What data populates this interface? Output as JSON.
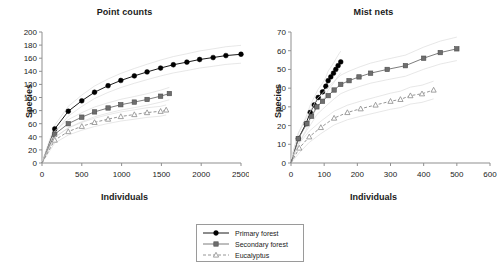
{
  "figure": {
    "legend": {
      "entries": [
        {
          "label": "Primary forest",
          "marker": "filled-circle",
          "line": "solid",
          "color": "#000000"
        },
        {
          "label": "Secondary forest",
          "marker": "filled-square",
          "line": "solid",
          "color": "#6e6e6e"
        },
        {
          "label": "Eucalyptus",
          "marker": "open-triangle",
          "line": "dashed",
          "color": "#8a8a8a"
        }
      ]
    }
  },
  "chart_data": [
    {
      "type": "line",
      "title": "Point counts",
      "xlabel": "Individuals",
      "ylabel": "Species",
      "xlim": [
        0,
        2500
      ],
      "ylim": [
        0,
        200
      ],
      "xticks": [
        0,
        500,
        1000,
        1500,
        2000,
        2500
      ],
      "yticks": [
        0,
        20,
        40,
        60,
        80,
        100,
        120,
        140,
        160,
        180,
        200
      ],
      "grid": false,
      "legend_position": "below-center-shared",
      "series": [
        {
          "name": "Primary forest",
          "marker": "filled-circle",
          "line": "solid",
          "color": "#000000",
          "x": [
            0,
            160,
            330,
            500,
            660,
            830,
            990,
            1160,
            1320,
            1490,
            1650,
            1820,
            1980,
            2150,
            2310,
            2500
          ],
          "y": [
            0,
            52,
            79,
            95,
            108,
            118,
            126,
            133,
            139,
            145,
            150,
            154,
            158,
            161,
            164,
            166
          ]
        },
        {
          "name": "Secondary forest",
          "marker": "filled-square",
          "line": "solid",
          "color": "#6e6e6e",
          "x": [
            0,
            160,
            330,
            500,
            660,
            830,
            990,
            1160,
            1320,
            1490,
            1600
          ],
          "y": [
            0,
            44,
            60,
            70,
            78,
            84,
            89,
            93,
            97,
            102,
            106
          ]
        },
        {
          "name": "Eucalyptus",
          "marker": "open-triangle",
          "line": "dashed",
          "color": "#8a8a8a",
          "x": [
            0,
            160,
            330,
            500,
            660,
            830,
            990,
            1160,
            1320,
            1490,
            1560
          ],
          "y": [
            0,
            35,
            48,
            56,
            62,
            67,
            71,
            74,
            77,
            79,
            81
          ]
        }
      ]
    },
    {
      "type": "line",
      "title": "Mist nets",
      "xlabel": "Individuals",
      "ylabel": "Species",
      "xlim": [
        0,
        600
      ],
      "ylim": [
        0,
        70
      ],
      "xticks": [
        0,
        100,
        200,
        300,
        400,
        500,
        600
      ],
      "yticks": [
        0,
        10,
        20,
        30,
        40,
        50,
        60,
        70
      ],
      "grid": false,
      "legend_position": "below-center-shared",
      "series": [
        {
          "name": "Primary forest",
          "marker": "filled-circle",
          "line": "solid",
          "color": "#000000",
          "x": [
            0,
            22,
            45,
            58,
            70,
            82,
            95,
            105,
            112,
            120,
            128,
            135,
            142,
            150
          ],
          "y": [
            0,
            13,
            21,
            27,
            31,
            35,
            38,
            41,
            44,
            46,
            48,
            50,
            52,
            54
          ]
        },
        {
          "name": "Secondary forest",
          "marker": "filled-square",
          "line": "solid",
          "color": "#6e6e6e",
          "x": [
            0,
            22,
            48,
            62,
            78,
            95,
            112,
            130,
            150,
            175,
            205,
            240,
            290,
            345,
            400,
            450,
            500
          ],
          "y": [
            0,
            13,
            21,
            25,
            30,
            33,
            36,
            39,
            42,
            44,
            46,
            48,
            50,
            52,
            56,
            59,
            61
          ]
        },
        {
          "name": "Eucalyptus",
          "marker": "open-triangle",
          "line": "dashed",
          "color": "#8a8a8a",
          "x": [
            0,
            25,
            55,
            90,
            130,
            170,
            210,
            255,
            300,
            330,
            360,
            395,
            430
          ],
          "y": [
            0,
            8,
            14,
            19,
            24,
            27,
            29,
            31,
            33,
            34,
            36,
            37,
            39
          ]
        }
      ]
    }
  ]
}
